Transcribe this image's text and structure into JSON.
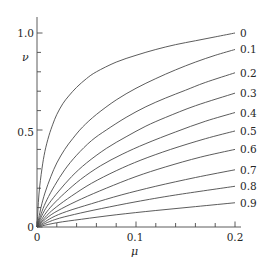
{
  "chart_data": {
    "type": "line",
    "title": "",
    "xlabel": "μ",
    "ylabel": "ν",
    "xlim": [
      0,
      0.2
    ],
    "ylim": [
      0,
      1.1
    ],
    "grid": false,
    "legend_position": "right-of-curve-ends",
    "x_tick_labels": [
      "0",
      "0.1",
      "0.2"
    ],
    "x_tick_values": [
      0,
      0.1,
      0.2
    ],
    "x_minor_tick_values": [
      0.02,
      0.04,
      0.06,
      0.08,
      0.12,
      0.14,
      0.16,
      0.18
    ],
    "y_tick_labels": [
      "0",
      "0.5",
      "1.0"
    ],
    "y_tick_values": [
      0,
      0.5,
      1.0
    ],
    "y_minor_tick_values": [
      0.1,
      0.2,
      0.3,
      0.4,
      0.6,
      0.7,
      0.8,
      0.9,
      1.1
    ],
    "line_color": "#4a4a4a",
    "line_width": 0.9,
    "series": [
      {
        "name": "0",
        "label": "0",
        "x": [
          0,
          0.002,
          0.005,
          0.008,
          0.012,
          0.016,
          0.02,
          0.026,
          0.032,
          0.04,
          0.05,
          0.06,
          0.08,
          0.1,
          0.12,
          0.14,
          0.16,
          0.18,
          0.2
        ],
        "values": [
          0,
          0.17,
          0.3,
          0.39,
          0.47,
          0.53,
          0.58,
          0.635,
          0.675,
          0.72,
          0.765,
          0.8,
          0.85,
          0.885,
          0.915,
          0.94,
          0.96,
          0.98,
          1.0
        ]
      },
      {
        "name": "0.1",
        "label": "0.1",
        "x": [
          0,
          0.004,
          0.008,
          0.014,
          0.02,
          0.028,
          0.036,
          0.046,
          0.06,
          0.08,
          0.1,
          0.12,
          0.14,
          0.16,
          0.18,
          0.2
        ],
        "values": [
          0,
          0.1,
          0.175,
          0.26,
          0.33,
          0.4,
          0.455,
          0.515,
          0.58,
          0.655,
          0.715,
          0.765,
          0.81,
          0.85,
          0.885,
          0.915
        ]
      },
      {
        "name": "0.2",
        "label": "0.2",
        "x": [
          0,
          0.005,
          0.01,
          0.018,
          0.028,
          0.04,
          0.055,
          0.07,
          0.09,
          0.11,
          0.13,
          0.15,
          0.17,
          0.2
        ],
        "values": [
          0,
          0.08,
          0.14,
          0.215,
          0.295,
          0.37,
          0.445,
          0.5,
          0.565,
          0.62,
          0.665,
          0.705,
          0.745,
          0.795
        ]
      },
      {
        "name": "0.3",
        "label": "0.3",
        "x": [
          0,
          0.006,
          0.012,
          0.022,
          0.035,
          0.05,
          0.07,
          0.09,
          0.11,
          0.13,
          0.16,
          0.2
        ],
        "values": [
          0,
          0.07,
          0.12,
          0.185,
          0.26,
          0.33,
          0.405,
          0.465,
          0.52,
          0.565,
          0.625,
          0.69
        ]
      },
      {
        "name": "0.4",
        "label": "0.4",
        "x": [
          0,
          0.008,
          0.016,
          0.028,
          0.044,
          0.064,
          0.086,
          0.11,
          0.14,
          0.17,
          0.2
        ],
        "values": [
          0,
          0.065,
          0.115,
          0.175,
          0.245,
          0.315,
          0.375,
          0.43,
          0.49,
          0.545,
          0.59
        ]
      },
      {
        "name": "0.5",
        "label": "0.5",
        "x": [
          0,
          0.01,
          0.02,
          0.035,
          0.055,
          0.08,
          0.105,
          0.135,
          0.17,
          0.2
        ],
        "values": [
          0,
          0.06,
          0.105,
          0.16,
          0.225,
          0.29,
          0.345,
          0.4,
          0.455,
          0.495
        ]
      },
      {
        "name": "0.6",
        "label": "0.6",
        "x": [
          0,
          0.012,
          0.025,
          0.045,
          0.07,
          0.1,
          0.13,
          0.165,
          0.2
        ],
        "values": [
          0,
          0.055,
          0.095,
          0.145,
          0.2,
          0.26,
          0.31,
          0.36,
          0.4
        ]
      },
      {
        "name": "0.7",
        "label": "0.7",
        "x": [
          0,
          0.015,
          0.03,
          0.055,
          0.085,
          0.12,
          0.16,
          0.2
        ],
        "values": [
          0,
          0.048,
          0.08,
          0.12,
          0.165,
          0.21,
          0.255,
          0.295
        ]
      },
      {
        "name": "0.8",
        "label": "0.8",
        "x": [
          0,
          0.018,
          0.038,
          0.065,
          0.1,
          0.14,
          0.2
        ],
        "values": [
          0,
          0.038,
          0.065,
          0.095,
          0.13,
          0.165,
          0.21
        ]
      },
      {
        "name": "0.9",
        "label": "0.9",
        "x": [
          0,
          0.02,
          0.045,
          0.08,
          0.12,
          0.16,
          0.2
        ],
        "values": [
          0,
          0.022,
          0.04,
          0.063,
          0.085,
          0.105,
          0.125
        ]
      }
    ],
    "curve_end_labels": [
      "0",
      "0.1",
      "0.2",
      "0.3",
      "0.4",
      "0.5",
      "0.6",
      "0.7",
      "0.8",
      "0.9"
    ]
  },
  "axes": {
    "y_label": "ν",
    "x_label": "μ",
    "y_tick_labels": [
      "1.0",
      "0.5",
      "0"
    ],
    "x_tick_labels": [
      "0",
      "0.1",
      "0.2"
    ]
  }
}
